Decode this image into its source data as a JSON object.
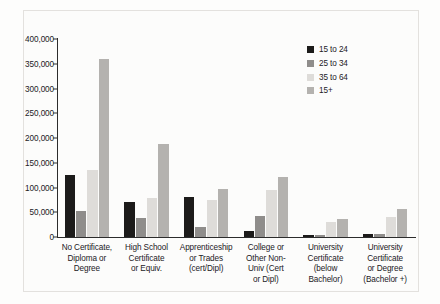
{
  "chart_data": {
    "type": "bar",
    "title": "",
    "xlabel": "",
    "ylabel": "",
    "ylim": [
      0,
      400000
    ],
    "ytick_labels": [
      "400,000",
      "350,000",
      "300,000",
      "250,000",
      "200,000",
      "150,000",
      "100,000",
      "50,000",
      "0"
    ],
    "ytick_values": [
      400000,
      350000,
      300000,
      250000,
      200000,
      150000,
      100000,
      50000,
      0
    ],
    "grid": false,
    "legend_position": "top-right",
    "categories": [
      "No Certificate,\nDiploma or\nDegree",
      "High School\nCertificate\nor Equiv.",
      "Apprenticeship\nor Trades\n(cert/Dipl)",
      "College or\nOther Non-\nUniv (Cert\nor Dipl)",
      "University\nCertificate\n(below\nBachelor)",
      "University\nCertificate\nor Degree\n(Bachelor +)"
    ],
    "series": [
      {
        "name": "15 to 24",
        "color": "#1c1b1a",
        "values": [
          125000,
          70000,
          80000,
          12000,
          4000,
          6000
        ]
      },
      {
        "name": "25 to 34",
        "color": "#8f8d8b",
        "values": [
          52000,
          38000,
          20000,
          42000,
          5000,
          7000
        ]
      },
      {
        "name": "35 to 64",
        "color": "#dedcd9",
        "values": [
          135000,
          78000,
          75000,
          95000,
          30000,
          40000
        ]
      },
      {
        "name": "15+",
        "color": "#b4b2af",
        "values": [
          360000,
          188000,
          97000,
          122000,
          36000,
          57000
        ]
      }
    ]
  }
}
